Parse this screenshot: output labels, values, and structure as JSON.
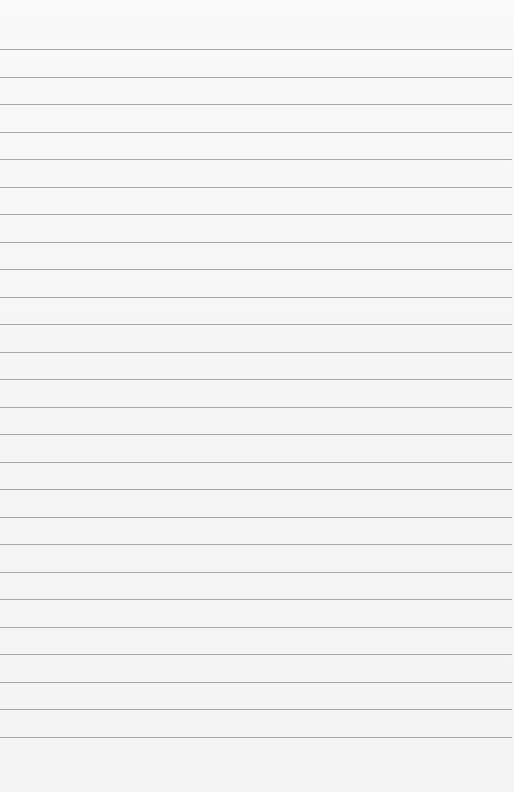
{
  "paper": {
    "type": "lined-paper",
    "background_color": "#f7f7f7",
    "rule_color": "#9a9a9a",
    "first_rule_y": 49,
    "rule_spacing": 27.5,
    "rule_count": 26
  }
}
